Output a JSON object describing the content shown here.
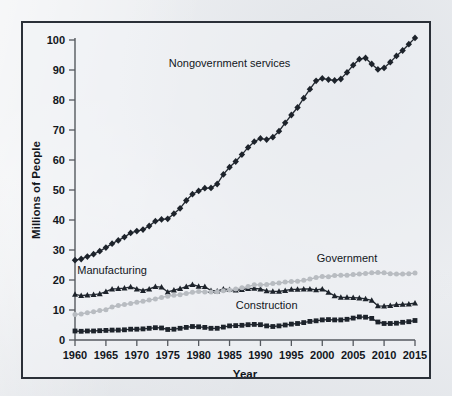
{
  "figure": {
    "background_color": "#eceef1",
    "frame_color": "#2b3038",
    "plot_background": "#f1f3f5"
  },
  "axes": {
    "x_title": "Year",
    "y_title": "Millions of People",
    "x_ticks": [
      "1960",
      "1965",
      "1970",
      "1975",
      "1980",
      "1985",
      "1990",
      "1995",
      "2000",
      "2005",
      "2010",
      "2015"
    ],
    "y_ticks": [
      "0",
      "10",
      "20",
      "30",
      "40",
      "50",
      "60",
      "70",
      "80",
      "90",
      "100"
    ]
  },
  "series_labels": {
    "nongovernment": "Nongovernment services",
    "manufacturing": "Manufacturing",
    "government": "Government",
    "construction": "Construction"
  },
  "chart_data": {
    "type": "line",
    "title": "",
    "xlabel": "Year",
    "ylabel": "Millions of People",
    "xlim": [
      1960,
      2015
    ],
    "ylim": [
      0,
      100
    ],
    "grid": false,
    "legend_position": "inline-annotations",
    "x": [
      1960,
      1961,
      1962,
      1963,
      1964,
      1965,
      1966,
      1967,
      1968,
      1969,
      1970,
      1971,
      1972,
      1973,
      1974,
      1975,
      1976,
      1977,
      1978,
      1979,
      1980,
      1981,
      1982,
      1983,
      1984,
      1985,
      1986,
      1987,
      1988,
      1989,
      1990,
      1991,
      1992,
      1993,
      1994,
      1995,
      1996,
      1997,
      1998,
      1999,
      2000,
      2001,
      2002,
      2003,
      2004,
      2005,
      2006,
      2007,
      2008,
      2009,
      2010,
      2011,
      2012,
      2013,
      2014,
      2015
    ],
    "series": [
      {
        "name": "Nongovernment services",
        "color": "#1d232b",
        "marker": "diamond",
        "values": [
          26.6,
          27.0,
          27.8,
          28.6,
          29.6,
          30.8,
          32.1,
          33.2,
          34.3,
          35.7,
          36.3,
          36.8,
          38.0,
          39.6,
          40.2,
          40.4,
          42.1,
          43.9,
          46.5,
          48.6,
          49.7,
          50.6,
          50.7,
          52.0,
          55.2,
          57.6,
          59.5,
          61.8,
          64.2,
          66.1,
          67.2,
          66.8,
          67.6,
          69.6,
          72.4,
          75.0,
          77.5,
          80.6,
          83.6,
          86.4,
          87.2,
          86.8,
          86.5,
          87.0,
          89.2,
          91.6,
          93.6,
          94.0,
          92.0,
          90.2,
          90.7,
          92.6,
          94.7,
          96.5,
          98.6,
          100.7
        ]
      },
      {
        "name": "Manufacturing",
        "color": "#1d232b",
        "marker": "triangle",
        "values": [
          15.2,
          14.8,
          15.0,
          15.1,
          15.4,
          16.1,
          17.0,
          17.1,
          17.3,
          17.7,
          17.0,
          16.5,
          17.0,
          17.8,
          17.6,
          16.0,
          16.6,
          17.1,
          17.8,
          18.5,
          17.9,
          17.8,
          16.5,
          16.3,
          17.0,
          16.8,
          16.6,
          16.8,
          17.1,
          17.2,
          17.0,
          16.4,
          16.2,
          16.2,
          16.5,
          16.9,
          16.9,
          17.0,
          17.0,
          16.7,
          17.0,
          15.9,
          14.7,
          14.2,
          14.2,
          14.1,
          14.0,
          13.7,
          13.2,
          11.4,
          11.3,
          11.5,
          11.8,
          11.9,
          12.0,
          12.3
        ]
      },
      {
        "name": "Government",
        "color": "#b8bcc1",
        "marker": "circle",
        "values": [
          8.5,
          8.7,
          9.1,
          9.4,
          9.8,
          10.1,
          11.0,
          11.5,
          11.8,
          12.2,
          12.6,
          12.9,
          13.3,
          13.7,
          14.2,
          14.6,
          14.9,
          15.1,
          15.5,
          15.9,
          16.2,
          16.0,
          16.0,
          16.1,
          16.4,
          16.7,
          17.0,
          17.4,
          17.8,
          18.4,
          18.4,
          18.5,
          18.8,
          19.0,
          19.3,
          19.5,
          19.6,
          19.9,
          20.3,
          20.8,
          21.2,
          21.1,
          21.5,
          21.6,
          21.6,
          21.8,
          22.0,
          22.2,
          22.4,
          22.5,
          22.4,
          22.1,
          22.0,
          22.0,
          22.1,
          22.3
        ]
      },
      {
        "name": "Construction",
        "color": "#1d232b",
        "marker": "square",
        "values": [
          3.0,
          2.9,
          3.0,
          3.0,
          3.1,
          3.2,
          3.3,
          3.3,
          3.4,
          3.6,
          3.6,
          3.7,
          3.9,
          4.1,
          4.0,
          3.5,
          3.6,
          3.9,
          4.2,
          4.5,
          4.4,
          4.2,
          3.9,
          3.9,
          4.3,
          4.7,
          4.8,
          4.9,
          5.1,
          5.2,
          5.1,
          4.7,
          4.5,
          4.7,
          5.0,
          5.3,
          5.5,
          5.8,
          6.2,
          6.4,
          6.7,
          6.8,
          6.7,
          6.7,
          6.9,
          7.3,
          7.7,
          7.6,
          7.2,
          6.0,
          5.5,
          5.5,
          5.6,
          5.9,
          6.1,
          6.5
        ]
      }
    ],
    "annotations": [
      {
        "text": "Nongovernment services",
        "x": 1985,
        "y": 91
      },
      {
        "text": "Manufacturing",
        "x": 1966,
        "y": 22
      },
      {
        "text": "Government",
        "x": 2004,
        "y": 26
      },
      {
        "text": "Construction",
        "x": 1991,
        "y": 10.5
      }
    ]
  }
}
